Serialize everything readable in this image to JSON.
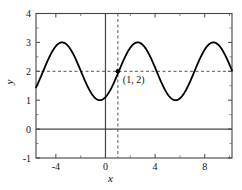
{
  "chart_data": {
    "type": "line",
    "title": "",
    "xlabel": "x",
    "ylabel": "y",
    "xlim": [
      -5.6,
      10.2
    ],
    "ylim": [
      -1,
      4
    ],
    "xticks": [
      -4,
      0,
      4,
      8
    ],
    "xticklabels": [
      "-4",
      "0",
      "4",
      "8"
    ],
    "yticks": [
      -1,
      0,
      1,
      2,
      3,
      4
    ],
    "yticklabels": [
      "-1",
      "0",
      "1",
      "2",
      "3",
      "4"
    ],
    "grid": false,
    "legend": null,
    "curve": {
      "name": "sinusoid",
      "equation": "y = 2 + cos(2*pi*(x - 2.6)/6.1)",
      "midline": 2,
      "amplitude": 1,
      "period": 6.1,
      "peak_value": 3,
      "trough_value": 1,
      "peaks_x": [
        -3.5,
        2.6,
        8.7
      ],
      "troughs_x": [
        -0.45,
        5.65
      ],
      "color": "#000000",
      "linewidth": 1.8
    },
    "reference_lines": [
      {
        "name": "y-zero-axis",
        "orientation": "horizontal",
        "value": 0,
        "style": "solid",
        "color": "#444444"
      },
      {
        "name": "x-zero-axis",
        "orientation": "vertical",
        "value": 0,
        "style": "solid",
        "color": "#444444"
      },
      {
        "name": "y-equals-2-guide",
        "orientation": "horizontal",
        "value": 2,
        "style": "dashed",
        "color": "#555555"
      },
      {
        "name": "x-equals-1-guide",
        "orientation": "vertical",
        "value": 1,
        "style": "dashed",
        "color": "#555555"
      }
    ],
    "annotations": [
      {
        "name": "point-1-2",
        "label": "(1, 2)",
        "x": 1,
        "y": 2,
        "marker": "dot",
        "marker_color": "#000000"
      }
    ]
  }
}
